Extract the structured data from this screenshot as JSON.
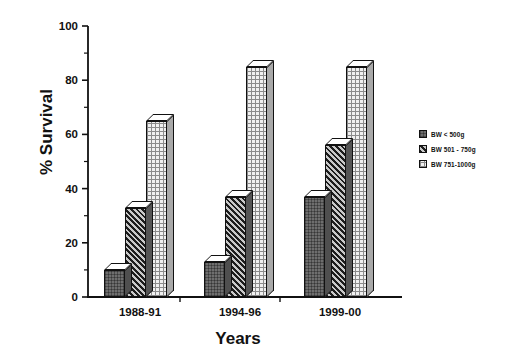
{
  "chart_data": {
    "type": "bar",
    "title": "",
    "xlabel": "Years",
    "ylabel": "% Survival",
    "categories": [
      "1988-91",
      "1994-96",
      "1999-00"
    ],
    "series": [
      {
        "name": "BW < 500g",
        "values": [
          10,
          13,
          37
        ]
      },
      {
        "name": "BW 501 - 750g",
        "values": [
          33,
          37,
          56
        ]
      },
      {
        "name": "BW 751-1000g",
        "values": [
          65,
          85,
          85
        ]
      }
    ],
    "ylim": [
      0,
      100
    ],
    "yticks": [
      0,
      20,
      40,
      60,
      80,
      100
    ],
    "ytick_labels": [
      "0",
      "20",
      "40",
      "60",
      "80",
      "100"
    ],
    "minor_tick_step": 10,
    "grid": false,
    "legend_position": "right",
    "style": "3d-bar",
    "background": "#ffffff",
    "axis_color": "#111111"
  },
  "legend": {
    "items": [
      {
        "label": "BW < 500g",
        "pattern": "dark-solid"
      },
      {
        "label": "BW 501 - 750g",
        "pattern": "dark-diagonal-hatch"
      },
      {
        "label": "BW 751-1000g",
        "pattern": "light-grid"
      }
    ]
  }
}
